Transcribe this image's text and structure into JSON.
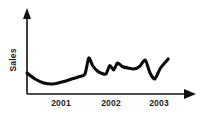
{
  "chart_data": {
    "type": "line",
    "title": "",
    "xlabel": "",
    "ylabel": "Sales",
    "grid": false,
    "legend": false,
    "xlim": [
      2000.45,
      2003.5
    ],
    "ylim": [
      0,
      100
    ],
    "tick_labels": {
      "x": [
        "2001",
        "2002",
        "2003"
      ],
      "y": []
    },
    "axis_style": {
      "x_axis_arrow": true,
      "y_axis_arrow": true,
      "line_color": "#0b0b0b",
      "axis_color": "#111111"
    },
    "series": [
      {
        "name": "Sales",
        "x": [
          2000.45,
          2000.62,
          2000.8,
          2001.0,
          2001.18,
          2001.35,
          2001.52,
          2001.66,
          2001.74,
          2001.82,
          2001.92,
          2002.02,
          2002.1,
          2002.18,
          2002.26,
          2002.34,
          2002.44,
          2002.56,
          2002.68,
          2002.8,
          2002.92,
          2003.02,
          2003.12,
          2003.24,
          2003.4
        ],
        "y": [
          42,
          30,
          22,
          20,
          24,
          29,
          34,
          40,
          72,
          57,
          46,
          41,
          40,
          57,
          48,
          62,
          55,
          52,
          50,
          55,
          68,
          42,
          30,
          52,
          70
        ]
      }
    ]
  },
  "labels": {
    "y_title": "Sales",
    "x_tick_1": "2001",
    "x_tick_2": "2002",
    "x_tick_3": "2003"
  }
}
